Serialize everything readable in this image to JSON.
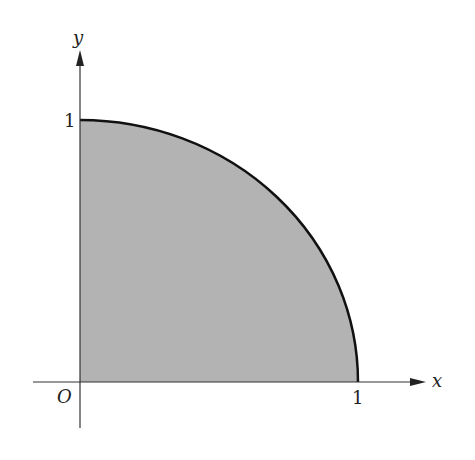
{
  "diagram": {
    "axes": {
      "x_label": "x",
      "y_label": "y",
      "origin_label": "O"
    },
    "ticks": {
      "x_tick_label": "1",
      "y_tick_label": "1"
    },
    "region": {
      "shape": "quarter-circle",
      "radius": 1,
      "fill_color": "#b3b3b3",
      "stroke_color": "#111111"
    },
    "colors": {
      "axis": "#333333",
      "background": "#ffffff"
    }
  }
}
